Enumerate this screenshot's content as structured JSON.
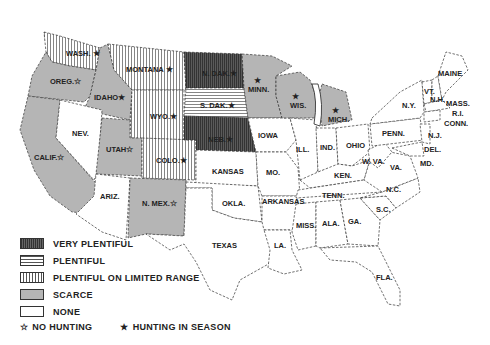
{
  "map": {
    "title": "",
    "categories": {
      "very_plentiful": {
        "label": "VERY PLENTIFUL",
        "pattern": "dark-vertical-hatch",
        "color": "#444444"
      },
      "plentiful": {
        "label": "PLENTIFUL",
        "pattern": "horizontal-lines",
        "color": "#ffffff"
      },
      "plentiful_limited": {
        "label": "PLENTIFUL ON LIMITED RANGE",
        "pattern": "vertical-lines",
        "color": "#ffffff"
      },
      "scarce": {
        "label": "SCARCE",
        "pattern": "solid-gray",
        "color": "#b5b5b5"
      },
      "none": {
        "label": "NONE",
        "pattern": "blank",
        "color": "#ffffff"
      }
    },
    "symbols": {
      "no_hunting": {
        "glyph": "☆",
        "label": "NO HUNTING"
      },
      "hunting_in_season": {
        "glyph": "★",
        "label": "HUNTING IN SEASON"
      }
    },
    "states": [
      {
        "name": "WASH.",
        "category": "plentiful_limited",
        "symbol": "★"
      },
      {
        "name": "OREG.",
        "category": "scarce",
        "symbol": "☆"
      },
      {
        "name": "CALIF.",
        "category": "scarce",
        "symbol": "☆"
      },
      {
        "name": "IDAHO",
        "category": "scarce",
        "symbol": "★"
      },
      {
        "name": "NEV.",
        "category": "none",
        "symbol": ""
      },
      {
        "name": "MONTANA",
        "category": "plentiful_limited",
        "symbol": "★"
      },
      {
        "name": "WYO.",
        "category": "plentiful_limited",
        "symbol": "★"
      },
      {
        "name": "UTAH",
        "category": "scarce",
        "symbol": "☆"
      },
      {
        "name": "ARIZ.",
        "category": "none",
        "symbol": ""
      },
      {
        "name": "COLO.",
        "category": "plentiful_limited",
        "symbol": "★"
      },
      {
        "name": "N. MEX.",
        "category": "scarce",
        "symbol": "☆"
      },
      {
        "name": "N. DAK.",
        "category": "very_plentiful",
        "symbol": "★"
      },
      {
        "name": "S. DAK.",
        "category": "plentiful",
        "symbol": "★"
      },
      {
        "name": "NEB.",
        "category": "very_plentiful",
        "symbol": "★"
      },
      {
        "name": "KANSAS",
        "category": "none",
        "symbol": ""
      },
      {
        "name": "OKLA.",
        "category": "none",
        "symbol": ""
      },
      {
        "name": "TEXAS",
        "category": "none",
        "symbol": ""
      },
      {
        "name": "MINN.",
        "category": "scarce",
        "symbol": "★"
      },
      {
        "name": "IOWA",
        "category": "none",
        "symbol": ""
      },
      {
        "name": "MO.",
        "category": "none",
        "symbol": ""
      },
      {
        "name": "ARKANSAS",
        "category": "none",
        "symbol": ""
      },
      {
        "name": "LA.",
        "category": "none",
        "symbol": ""
      },
      {
        "name": "WIS.",
        "category": "scarce",
        "symbol": "★"
      },
      {
        "name": "ILL.",
        "category": "none",
        "symbol": ""
      },
      {
        "name": "MICH.",
        "category": "scarce",
        "symbol": "★"
      },
      {
        "name": "IND.",
        "category": "none",
        "symbol": ""
      },
      {
        "name": "OHIO",
        "category": "none",
        "symbol": ""
      },
      {
        "name": "KEN.",
        "category": "none",
        "symbol": ""
      },
      {
        "name": "TENN.",
        "category": "none",
        "symbol": ""
      },
      {
        "name": "MISS.",
        "category": "none",
        "symbol": ""
      },
      {
        "name": "ALA.",
        "category": "none",
        "symbol": ""
      },
      {
        "name": "GA.",
        "category": "none",
        "symbol": ""
      },
      {
        "name": "FLA.",
        "category": "none",
        "symbol": ""
      },
      {
        "name": "S.C.",
        "category": "none",
        "symbol": ""
      },
      {
        "name": "N.C.",
        "category": "none",
        "symbol": ""
      },
      {
        "name": "VA.",
        "category": "none",
        "symbol": ""
      },
      {
        "name": "W. VA.",
        "category": "none",
        "symbol": ""
      },
      {
        "name": "PENN.",
        "category": "none",
        "symbol": ""
      },
      {
        "name": "N.Y.",
        "category": "none",
        "symbol": ""
      },
      {
        "name": "VT.",
        "category": "none",
        "symbol": ""
      },
      {
        "name": "N.H.",
        "category": "none",
        "symbol": ""
      },
      {
        "name": "MAINE",
        "category": "none",
        "symbol": ""
      },
      {
        "name": "MASS.",
        "category": "none",
        "symbol": ""
      },
      {
        "name": "R.I.",
        "category": "none",
        "symbol": ""
      },
      {
        "name": "CONN.",
        "category": "none",
        "symbol": ""
      },
      {
        "name": "N.J.",
        "category": "none",
        "symbol": ""
      },
      {
        "name": "DEL.",
        "category": "none",
        "symbol": ""
      },
      {
        "name": "MD.",
        "category": "none",
        "symbol": ""
      }
    ]
  },
  "legend": {
    "items": [
      {
        "label": "VERY PLENTIFUL"
      },
      {
        "label": "PLENTIFUL"
      },
      {
        "label": "PLENTIFUL ON LIMITED RANGE"
      },
      {
        "label": "SCARCE"
      },
      {
        "label": "NONE"
      }
    ],
    "no_hunting": {
      "glyph": "☆",
      "label": "NO HUNTING"
    },
    "hunting": {
      "glyph": "★",
      "label": "HUNTING IN SEASON"
    }
  },
  "labels": {
    "wash": "WASH. ★",
    "oreg": "OREG.☆",
    "calif": "CALIF.☆",
    "idaho": "IDAHO★",
    "nev": "NEV.",
    "montana": "MONTANA ★",
    "wyo": "WYO.★",
    "utah": "UTAH☆",
    "ariz": "ARIZ.",
    "colo": "COLO.★",
    "nmex": "N. MEX.☆",
    "ndak": "N. DAK.★",
    "sdak": "S. DAK.★",
    "neb": "NEB.★",
    "kansas": "KANSAS",
    "okla": "OKLA.",
    "texas": "TEXAS",
    "minn": "MINN.",
    "iowa": "IOWA",
    "mo": "MO.",
    "arkansas": "ARKANSAS",
    "la": "LA.",
    "wis": "WIS.",
    "ill": "ILL.",
    "mich": "MICH.",
    "ind": "IND.",
    "ohio": "OHIO",
    "ken": "KEN.",
    "tenn": "TENN.",
    "miss": "MISS.",
    "ala": "ALA.",
    "ga": "GA.",
    "fla": "FLA.",
    "sc": "S.C.",
    "nc": "N.C.",
    "va": "VA.",
    "wva": "W. VA.",
    "penn": "PENN.",
    "ny": "N.Y.",
    "vt": "VT.",
    "nh": "N.H.",
    "maine": "MAINE",
    "mass": "MASS.",
    "ri": "R.I.",
    "conn": "CONN.",
    "nj": "N.J.",
    "del": "DEL.",
    "md": "MD.",
    "star": "★"
  }
}
